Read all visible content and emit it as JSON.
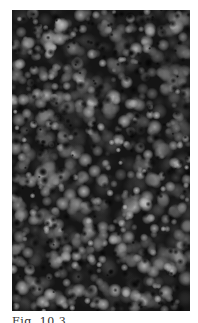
{
  "figure": {
    "type": "grayscale-micrograph",
    "palette": {
      "background": "#1a1a1a",
      "grain_dark": "#3a3a3a",
      "grain_mid": "#7a7a7a",
      "grain_light": "#bdbdbd"
    }
  },
  "caption": {
    "text": "Fig. 10.3",
    "visibility": "clipped — only top of glyphs visible, illegible"
  }
}
